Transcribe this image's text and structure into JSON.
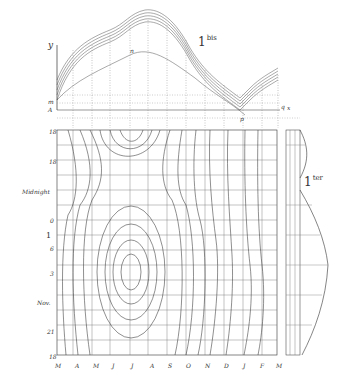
{
  "figure": {
    "top_panel": {
      "label": "1",
      "label_sup": "bis",
      "axis_y": "y",
      "axis_x": "x",
      "points": {
        "m": "m",
        "A": "A",
        "n": "n",
        "p": "p",
        "q": "q"
      }
    },
    "main_panel": {
      "hour_labels": [
        "M",
        "N",
        "Midnight",
        "D",
        "1",
        "6",
        "3",
        "Nov.",
        "21",
        "M"
      ],
      "month_labels": [
        "M",
        "A",
        "M",
        "J",
        "J",
        "A",
        "S",
        "O",
        "N",
        "D",
        "J",
        "F",
        "M"
      ],
      "row_markers": [
        "18",
        "18",
        "Midnight",
        "0",
        "1",
        "6",
        "3",
        "Nov.",
        "21",
        "18"
      ]
    },
    "side_panel": {
      "label": "1",
      "label_sup": "ter"
    }
  }
}
